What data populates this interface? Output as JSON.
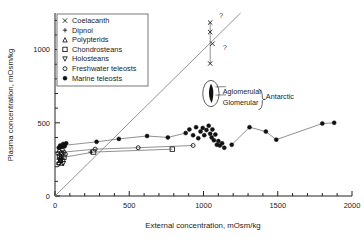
{
  "chart_data": {
    "type": "scatter",
    "title": "",
    "xlabel": "External concentration, mOsm/kg",
    "ylabel": "Plasma concentration, mOsm/kg",
    "xlim": [
      0,
      2000
    ],
    "ylim": [
      0,
      1250
    ],
    "x_ticks_major": [
      0,
      500,
      1000,
      1500,
      2000
    ],
    "x_tick_labels": [
      "0",
      "500",
      "1000",
      "1500",
      "2000"
    ],
    "x_tick_minor_step": 100,
    "y_ticks_major": [
      0,
      500,
      1000
    ],
    "y_tick_labels": [
      "0",
      "500",
      "1000"
    ],
    "y_tick_minor_step": 100,
    "grid": false,
    "legend_position": "top-left",
    "reference_line": {
      "name": "isosmotic-line",
      "label": "",
      "from": [
        0,
        0
      ],
      "to": [
        1250,
        1250
      ]
    },
    "annotations": [
      {
        "name": "aglomerular-label",
        "text": "Aglomerular",
        "x": 1130,
        "y": 700
      },
      {
        "name": "glomerular-label",
        "text": "Glomerular",
        "x": 1130,
        "y": 620
      },
      {
        "name": "antarctic-label",
        "text": "Antarctic",
        "x": 1420,
        "y": 660
      },
      {
        "name": "query-upper",
        "text": "?",
        "x": 1105,
        "y": 1215
      },
      {
        "name": "query-lower",
        "text": "?",
        "x": 1130,
        "y": 1000
      }
    ],
    "series": [
      {
        "name": "Coelacanth",
        "marker": "x",
        "filled": false,
        "points": [
          [
            1045,
            1185
          ],
          [
            1045,
            1120
          ],
          [
            1060,
            1040
          ],
          [
            1045,
            905
          ]
        ]
      },
      {
        "name": "Dipnoi",
        "marker": "plus",
        "filled": false,
        "points": [
          [
            25,
            250
          ],
          [
            30,
            265
          ],
          [
            35,
            240
          ],
          [
            40,
            275
          ],
          [
            50,
            255
          ],
          [
            240,
            300
          ]
        ]
      },
      {
        "name": "Polypterids",
        "marker": "triangle-up",
        "filled": false,
        "points": [
          [
            25,
            230
          ],
          [
            35,
            245
          ],
          [
            45,
            225
          ],
          [
            55,
            250
          ]
        ]
      },
      {
        "name": "Chondrosteans",
        "marker": "square-open",
        "filled": false,
        "points": [
          [
            30,
            270
          ],
          [
            45,
            285
          ],
          [
            60,
            265
          ],
          [
            260,
            300
          ],
          [
            790,
            320
          ]
        ]
      },
      {
        "name": "Holosteans",
        "marker": "triangle-down",
        "filled": false,
        "points": [
          [
            25,
            215
          ],
          [
            40,
            235
          ],
          [
            55,
            220
          ]
        ]
      },
      {
        "name": "Freshwater teleosts",
        "marker": "circle-open",
        "filled": false,
        "points": [
          [
            20,
            290
          ],
          [
            30,
            305
          ],
          [
            40,
            295
          ],
          [
            50,
            315
          ],
          [
            60,
            300
          ],
          [
            70,
            285
          ],
          [
            270,
            320
          ],
          [
            560,
            330
          ],
          [
            930,
            345
          ]
        ]
      },
      {
        "name": "Marine teleosts",
        "marker": "circle-filled",
        "filled": true,
        "points": [
          [
            25,
            330
          ],
          [
            35,
            345
          ],
          [
            45,
            335
          ],
          [
            55,
            355
          ],
          [
            65,
            340
          ],
          [
            75,
            360
          ],
          [
            280,
            370
          ],
          [
            430,
            390
          ],
          [
            620,
            410
          ],
          [
            760,
            400
          ],
          [
            880,
            430
          ],
          [
            905,
            455
          ],
          [
            930,
            415
          ],
          [
            950,
            470
          ],
          [
            965,
            395
          ],
          [
            980,
            440
          ],
          [
            995,
            465
          ],
          [
            1005,
            415
          ],
          [
            1020,
            450
          ],
          [
            1035,
            480
          ],
          [
            1045,
            425
          ],
          [
            1055,
            400
          ],
          [
            1060,
            455
          ],
          [
            1070,
            380
          ],
          [
            1080,
            420
          ],
          [
            1090,
            350
          ],
          [
            1100,
            375
          ],
          [
            1110,
            345
          ],
          [
            1125,
            360
          ],
          [
            1140,
            330
          ],
          [
            1190,
            350
          ],
          [
            1310,
            470
          ],
          [
            1420,
            440
          ],
          [
            1490,
            385
          ],
          [
            1800,
            495
          ],
          [
            1880,
            500
          ]
        ]
      }
    ],
    "callout": {
      "name": "antarctic-cluster-ellipse",
      "center_x": 1050,
      "center_y": 700,
      "rx": 55,
      "ry": 90
    }
  }
}
